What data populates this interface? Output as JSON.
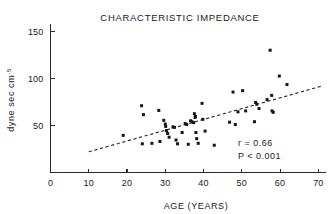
{
  "chart_data": {
    "type": "scatter",
    "title": "CHARACTERISTIC IMPEDANCE",
    "xlabel": "AGE  (YEARS)",
    "ylabel": "dyne sec cm",
    "ylabel_exponent": "-5",
    "xlim": [
      0,
      72
    ],
    "ylim": [
      0,
      160
    ],
    "xticks": [
      0,
      10,
      20,
      30,
      40,
      50,
      60,
      70
    ],
    "xtick_labels": [
      "0",
      "10",
      "20",
      "30",
      "40",
      "50",
      "60",
      "70"
    ],
    "yticks": [
      50,
      100,
      150
    ],
    "ytick_labels": [
      "50",
      "100",
      "150"
    ],
    "grid": false,
    "legend": "none",
    "annotations": [
      {
        "name": "correlation",
        "text": "r = 0.66"
      },
      {
        "name": "p-value",
        "text": "P < 0.001"
      }
    ],
    "regression_line": {
      "style": "dashed",
      "x_start": 10,
      "y_start": 22,
      "x_end": 71,
      "y_end": 92
    },
    "points": [
      {
        "x": 19.0,
        "y": 39.5
      },
      {
        "x": 23.8,
        "y": 71.0
      },
      {
        "x": 24.3,
        "y": 61.5
      },
      {
        "x": 24.0,
        "y": 30.5
      },
      {
        "x": 26.5,
        "y": 31.0
      },
      {
        "x": 28.3,
        "y": 66.0
      },
      {
        "x": 28.6,
        "y": 33.0
      },
      {
        "x": 29.6,
        "y": 55.5
      },
      {
        "x": 30.0,
        "y": 51.5
      },
      {
        "x": 30.1,
        "y": 49.0
      },
      {
        "x": 30.3,
        "y": 44.5
      },
      {
        "x": 30.6,
        "y": 41.5
      },
      {
        "x": 31.0,
        "y": 37.5
      },
      {
        "x": 32.0,
        "y": 48.5
      },
      {
        "x": 32.4,
        "y": 48.0
      },
      {
        "x": 32.8,
        "y": 34.5
      },
      {
        "x": 33.2,
        "y": 30.5
      },
      {
        "x": 34.4,
        "y": 42.5
      },
      {
        "x": 35.2,
        "y": 52.0
      },
      {
        "x": 35.6,
        "y": 51.0
      },
      {
        "x": 36.0,
        "y": 30.0
      },
      {
        "x": 36.6,
        "y": 55.0
      },
      {
        "x": 37.0,
        "y": 54.0
      },
      {
        "x": 37.4,
        "y": 53.0
      },
      {
        "x": 37.6,
        "y": 62.5
      },
      {
        "x": 37.8,
        "y": 58.5
      },
      {
        "x": 37.9,
        "y": 59.5
      },
      {
        "x": 38.0,
        "y": 42.5
      },
      {
        "x": 38.2,
        "y": 36.0
      },
      {
        "x": 38.6,
        "y": 31.0
      },
      {
        "x": 39.6,
        "y": 73.5
      },
      {
        "x": 39.8,
        "y": 56.5
      },
      {
        "x": 40.4,
        "y": 44.0
      },
      {
        "x": 42.8,
        "y": 29.0
      },
      {
        "x": 46.8,
        "y": 53.5
      },
      {
        "x": 47.7,
        "y": 85.5
      },
      {
        "x": 48.3,
        "y": 51.0
      },
      {
        "x": 49.0,
        "y": 64.5
      },
      {
        "x": 50.2,
        "y": 87.0
      },
      {
        "x": 51.0,
        "y": 65.5
      },
      {
        "x": 53.3,
        "y": 54.0
      },
      {
        "x": 53.6,
        "y": 74.5
      },
      {
        "x": 53.9,
        "y": 72.5
      },
      {
        "x": 54.5,
        "y": 68.0
      },
      {
        "x": 56.6,
        "y": 77.5
      },
      {
        "x": 57.4,
        "y": 130.0
      },
      {
        "x": 57.8,
        "y": 82.0
      },
      {
        "x": 57.9,
        "y": 65.5
      },
      {
        "x": 58.2,
        "y": 64.0
      },
      {
        "x": 59.8,
        "y": 102.5
      },
      {
        "x": 61.8,
        "y": 93.5
      }
    ]
  }
}
